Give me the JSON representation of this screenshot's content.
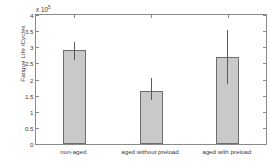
{
  "chart_data": {
    "type": "bar",
    "title": "",
    "xlabel": "",
    "ylabel": "Fatigue Life /Cycles",
    "y_axis_multiplier": "x 10",
    "y_axis_exponent": "5",
    "categories": [
      "non-aged",
      "aged without preload",
      "aged with preload"
    ],
    "values": [
      2.9,
      1.65,
      2.7
    ],
    "error_low": [
      2.6,
      1.35,
      1.85
    ],
    "error_high": [
      3.15,
      2.05,
      3.55
    ],
    "ylim": [
      0,
      4
    ],
    "ytick_labels": [
      "0",
      "0.5",
      "1",
      "1.5",
      "2",
      "2.5",
      "3",
      "3.5",
      "4"
    ],
    "ytick_values": [
      0,
      0.5,
      1,
      1.5,
      2,
      2.5,
      3,
      3.5,
      4
    ],
    "grid": false,
    "legend": null,
    "bar_color": "#c9c9c9",
    "bar_edge_color": "#6e6e6e",
    "error_color": "#5a5a5a",
    "axis_color": "#8a8a8a",
    "text_color": "#3a3a3a",
    "background": "#ffffff"
  }
}
